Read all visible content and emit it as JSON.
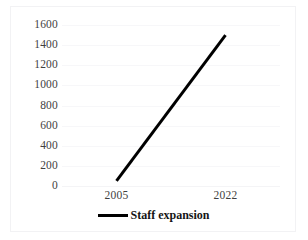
{
  "chart_data": {
    "type": "line",
    "title": "",
    "subtitle": "",
    "xlabel": "",
    "ylabel": "",
    "categories": [
      "2005",
      "2022"
    ],
    "x_tick_labels": [
      "2005",
      "2022"
    ],
    "y_tick_labels": [
      "1600",
      "1400",
      "1200",
      "1000",
      "800",
      "600",
      "400",
      "200",
      "0"
    ],
    "y_tick_values": [
      1600,
      1400,
      1200,
      1000,
      800,
      600,
      400,
      200,
      0
    ],
    "ylim": [
      0,
      1600
    ],
    "grid": true,
    "grid_axis": "y",
    "legend_position": "bottom-center",
    "series": [
      {
        "name": "Staff expansion",
        "color": "#000000",
        "line_width": 3,
        "values": [
          50,
          1500
        ]
      }
    ],
    "annotations": []
  },
  "legend": {
    "items": [
      {
        "label": "Staff expansion",
        "marker": "line-marker",
        "color": "#000000"
      }
    ]
  },
  "colors": {
    "background": "#ffffff",
    "series_line": "#000000",
    "gridline": "#f7f7f9",
    "border": "#f2f2f4",
    "tick_text": "#3f3f3f",
    "legend_text": "#151515"
  }
}
